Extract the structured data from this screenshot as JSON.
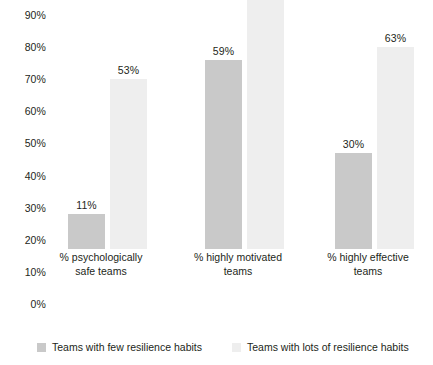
{
  "chart_data": {
    "type": "bar",
    "title": "",
    "subtitle": "",
    "xlabel": "",
    "ylabel": "",
    "ylim": [
      0,
      90
    ],
    "grid": false,
    "legend_position": "bottom",
    "y_ticks": [
      "90%",
      "80%",
      "70%",
      "60%",
      "50%",
      "40%",
      "30%",
      "20%",
      "10%",
      "0%"
    ],
    "y_tick_values": [
      90,
      80,
      70,
      60,
      50,
      40,
      30,
      20,
      10,
      0
    ],
    "categories": [
      "% psychologically safe teams",
      "% highly motivated teams",
      "% highly effective teams"
    ],
    "category_lines": [
      [
        "% psychologically",
        "safe teams"
      ],
      [
        "% highly motivated",
        "teams"
      ],
      [
        "% highly effective",
        "teams"
      ]
    ],
    "series": [
      {
        "name": "Teams with few resilience habits",
        "color": "#c9c9c9",
        "values": [
          11,
          59,
          30
        ],
        "labels": [
          "11%",
          "59%",
          "30%"
        ]
      },
      {
        "name": "Teams with lots of resilience habits",
        "color": "#eeeeee",
        "values": [
          53,
          84,
          63
        ],
        "labels": [
          "53%",
          "84%",
          "63%"
        ]
      }
    ]
  },
  "legend": {
    "items": [
      {
        "label": "Teams with few resilience habits",
        "swatch": "dark"
      },
      {
        "label": "Teams with lots of resilience habits",
        "swatch": "light"
      }
    ]
  }
}
